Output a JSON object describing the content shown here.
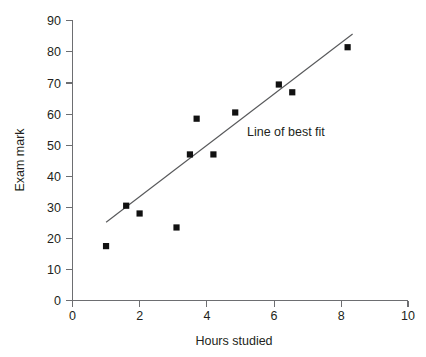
{
  "chart_data": {
    "type": "scatter",
    "title": "",
    "xlabel": "Hours studied",
    "ylabel": "Exam mark",
    "xlim": [
      0,
      10
    ],
    "ylim": [
      0,
      90
    ],
    "xticks": [
      0,
      2,
      4,
      6,
      8,
      10
    ],
    "yticks": [
      0,
      10,
      20,
      30,
      40,
      50,
      60,
      70,
      80,
      90
    ],
    "xtick_labels": [
      "0",
      "2",
      "4",
      "6",
      "8",
      "10"
    ],
    "ytick_labels": [
      "0",
      "10",
      "20",
      "30",
      "40",
      "50",
      "60",
      "70",
      "80",
      "90"
    ],
    "grid": false,
    "legend": "none",
    "marker": "square",
    "marker_color": "#111111",
    "points": [
      {
        "x": 1.0,
        "y": 17.5
      },
      {
        "x": 1.6,
        "y": 30.5
      },
      {
        "x": 2.0,
        "y": 28.0
      },
      {
        "x": 3.1,
        "y": 23.5
      },
      {
        "x": 3.5,
        "y": 47.0
      },
      {
        "x": 3.7,
        "y": 58.5
      },
      {
        "x": 4.2,
        "y": 47.0
      },
      {
        "x": 4.85,
        "y": 60.5
      },
      {
        "x": 6.15,
        "y": 69.5
      },
      {
        "x": 6.55,
        "y": 67.0
      },
      {
        "x": 8.2,
        "y": 81.5
      }
    ],
    "trendline": {
      "label": "Line of best fit",
      "x_start": 1.0,
      "y_start": 25.0,
      "x_end": 8.35,
      "y_end": 85.5,
      "color": "#58595b",
      "label_x": 5.2,
      "label_y": 54.0
    },
    "axis_color": "#6d6e71",
    "text_color": "#231f20"
  }
}
